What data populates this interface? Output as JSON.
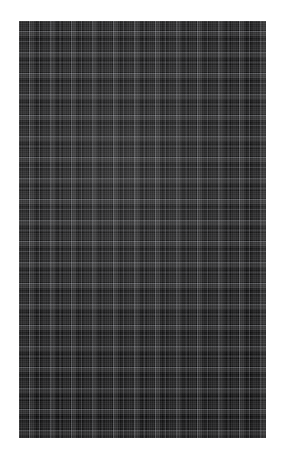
{
  "image": {
    "kind": "fabric-swatch-photo",
    "subject": "dark plaid / tartan woven textile",
    "alt_text": "Close-up photograph of a dark charcoal and black plaid woven fabric swatch",
    "canvas": {
      "width_px": 286,
      "height_px": 462,
      "background_color": "#ffffff"
    },
    "swatch": {
      "left_px": 19,
      "top_px": 21,
      "width_px": 247,
      "height_px": 417
    }
  },
  "pattern": {
    "name": "plaid",
    "weave": "twill / tartan check",
    "repeat_px": 21,
    "repeat_horizontal_px": 21,
    "repeat_vertical_px": 21,
    "symmetric": true,
    "colors": {
      "base_black": "#0c0c0d",
      "dark_charcoal": "#1b1b1e",
      "charcoal_block": "#26262a",
      "medium_grey_band": "#3a3a3f",
      "light_grid_line": "#6a6a70",
      "highlight_crossing": "#8a8c94"
    },
    "stripe_sequence": [
      {
        "label": "base-black",
        "width_px": 2,
        "color": "#0c0c0d"
      },
      {
        "label": "charcoal-block",
        "width_px": 7,
        "color": "#26262a"
      },
      {
        "label": "base-black",
        "width_px": 2,
        "color": "#0c0c0d"
      },
      {
        "label": "light-grid-line",
        "width_px": 1,
        "color": "#6a6a70"
      },
      {
        "label": "medium-grey-band",
        "width_px": 4,
        "color": "#3a3a3f"
      },
      {
        "label": "dark-charcoal",
        "width_px": 2,
        "color": "#1b1b1e"
      },
      {
        "label": "base-black",
        "width_px": 3,
        "color": "#0c0c0d"
      }
    ]
  }
}
